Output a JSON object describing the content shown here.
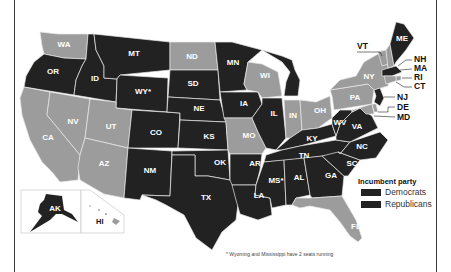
{
  "colors": {
    "dark": "#222222",
    "light": "#9c9c9c",
    "border": "#e8e8e8"
  },
  "legend": {
    "title": "Incumbent party",
    "items": [
      {
        "label": "Democrats",
        "color": "#222222"
      },
      {
        "label": "Republicans",
        "color": "#222222"
      }
    ]
  },
  "footnote": "* Wyoming and Mississippi have 2 seats running",
  "states": {
    "WA": "WA",
    "OR": "OR",
    "CA": "CA",
    "ID": "ID",
    "NV": "NV",
    "MT": "MT",
    "WY": "WY*",
    "UT": "UT",
    "AZ": "AZ",
    "CO": "CO",
    "NM": "NM",
    "ND": "ND",
    "SD": "SD",
    "NE": "NE",
    "KS": "KS",
    "OK": "OK",
    "TX": "TX",
    "MN": "MN",
    "IA": "IA",
    "MO": "MO",
    "AR": "AR",
    "LA": "LA",
    "WI": "WI",
    "IL": "IL",
    "MI": "MI",
    "IN": "IN",
    "OH": "OH",
    "KY": "KY",
    "TN": "TN",
    "MS": "MS*",
    "AL": "AL",
    "GA": "GA",
    "FL": "FL",
    "SC": "SC",
    "NC": "NC",
    "VA": "VA",
    "WV": "WV",
    "PA": "PA",
    "NY": "NY",
    "VT": "VT",
    "ME": "ME",
    "NH": "NH",
    "MA": "MA",
    "RI": "RI",
    "CT": "CT",
    "NJ": "NJ",
    "DE": "DE",
    "MD": "MD",
    "AK": "AK",
    "HI": "HI"
  },
  "shading": {
    "dark": [
      "OR",
      "ID",
      "MT",
      "WY",
      "CO",
      "NM",
      "SD",
      "NE",
      "KS",
      "OK",
      "TX",
      "MN",
      "IA",
      "AR",
      "LA",
      "IL",
      "MI",
      "KY",
      "TN",
      "MS",
      "AL",
      "GA",
      "SC",
      "NC",
      "VA",
      "WV",
      "ME",
      "MA",
      "NJ",
      "AK"
    ],
    "light": [
      "WA",
      "CA",
      "NV",
      "UT",
      "AZ",
      "ND",
      "WI",
      "MO",
      "IN",
      "OH",
      "PA",
      "NY",
      "VT",
      "NH",
      "RI",
      "CT",
      "DE",
      "MD",
      "FL",
      "HI"
    ]
  }
}
